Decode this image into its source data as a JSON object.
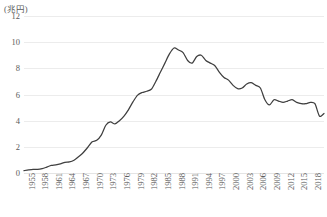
{
  "chart_data": {
    "type": "line",
    "title": "",
    "subtitle": "",
    "unit_label": "(兆円)",
    "xlabel": "",
    "ylabel": "",
    "ylim": [
      0,
      12
    ],
    "yticks": [
      0,
      2,
      4,
      6,
      8,
      10,
      12
    ],
    "ytick_labels": [
      "0",
      "2",
      "4",
      "6",
      "8",
      "10",
      "12"
    ],
    "xlim": [
      1955,
      2021
    ],
    "xtick_labels": [
      "1955",
      "1958",
      "1961",
      "1964",
      "1967",
      "1970",
      "1973",
      "1976",
      "1979",
      "1982",
      "1985",
      "1988",
      "1991",
      "1994",
      "1997",
      "2000",
      "2003",
      "2006",
      "2009",
      "2012",
      "2015",
      "2018",
      "2021"
    ],
    "xtick_step": 3,
    "grid": "horizontal",
    "legend": "none",
    "line_color": "#3f3f3f",
    "grid_color": "#ececec",
    "text_color": "#5a5a5a",
    "series": [
      {
        "name": "法人税収",
        "x": [
          1955,
          1956,
          1957,
          1958,
          1959,
          1960,
          1961,
          1962,
          1963,
          1964,
          1965,
          1966,
          1967,
          1968,
          1969,
          1970,
          1971,
          1972,
          1973,
          1974,
          1975,
          1976,
          1977,
          1978,
          1979,
          1980,
          1981,
          1982,
          1983,
          1984,
          1985,
          1986,
          1987,
          1988,
          1989,
          1990,
          1991,
          1992,
          1993,
          1994,
          1995,
          1996,
          1997,
          1998,
          1999,
          2000,
          2001,
          2002,
          2003,
          2004,
          2005,
          2006,
          2007,
          2008,
          2009,
          2010,
          2011,
          2012,
          2013,
          2014,
          2015,
          2016,
          2017,
          2018,
          2019,
          2020,
          2021
        ],
        "values": [
          0.18,
          0.24,
          0.28,
          0.27,
          0.33,
          0.45,
          0.58,
          0.62,
          0.7,
          0.82,
          0.85,
          0.98,
          1.25,
          1.55,
          1.95,
          2.38,
          2.5,
          2.9,
          3.65,
          3.9,
          3.75,
          4.0,
          4.35,
          4.85,
          5.45,
          5.95,
          6.15,
          6.25,
          6.4,
          7.0,
          7.7,
          8.4,
          9.1,
          9.55,
          9.4,
          9.2,
          8.6,
          8.4,
          8.9,
          9.0,
          8.6,
          8.4,
          8.2,
          7.7,
          7.3,
          7.1,
          6.7,
          6.45,
          6.5,
          6.8,
          6.9,
          6.7,
          6.5,
          5.6,
          5.2,
          5.6,
          5.5,
          5.4,
          5.5,
          5.6,
          5.4,
          5.3,
          5.3,
          5.4,
          5.3,
          4.35,
          4.55
        ],
        "peak_year": 1988,
        "peak_value": 9.55
      }
    ]
  }
}
